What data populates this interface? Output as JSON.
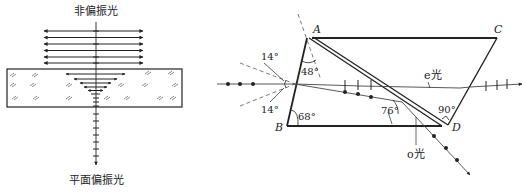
{
  "left_diagram": {
    "title_top": "非偏振光",
    "title_bottom": "平面偏振光",
    "description": "Unpolarized light passing through a dichroic crystal becomes plane-polarized light",
    "arrow_rows_above": 6,
    "arrow_rows_inside": 5
  },
  "right_diagram": {
    "vertices": {
      "A": "A",
      "B": "B",
      "C": "C",
      "D": "D"
    },
    "angles": {
      "top_incidence": "14°",
      "bottom_incidence": "14°",
      "angle_A": "48°",
      "angle_B": "68°",
      "angle_internal": "76°",
      "angle_D": "90°"
    },
    "rays": {
      "e_ray": "e光",
      "o_ray": "o光"
    }
  },
  "colors": {
    "line": "#222222",
    "dashed": "#555555",
    "background": "#ffffff"
  }
}
